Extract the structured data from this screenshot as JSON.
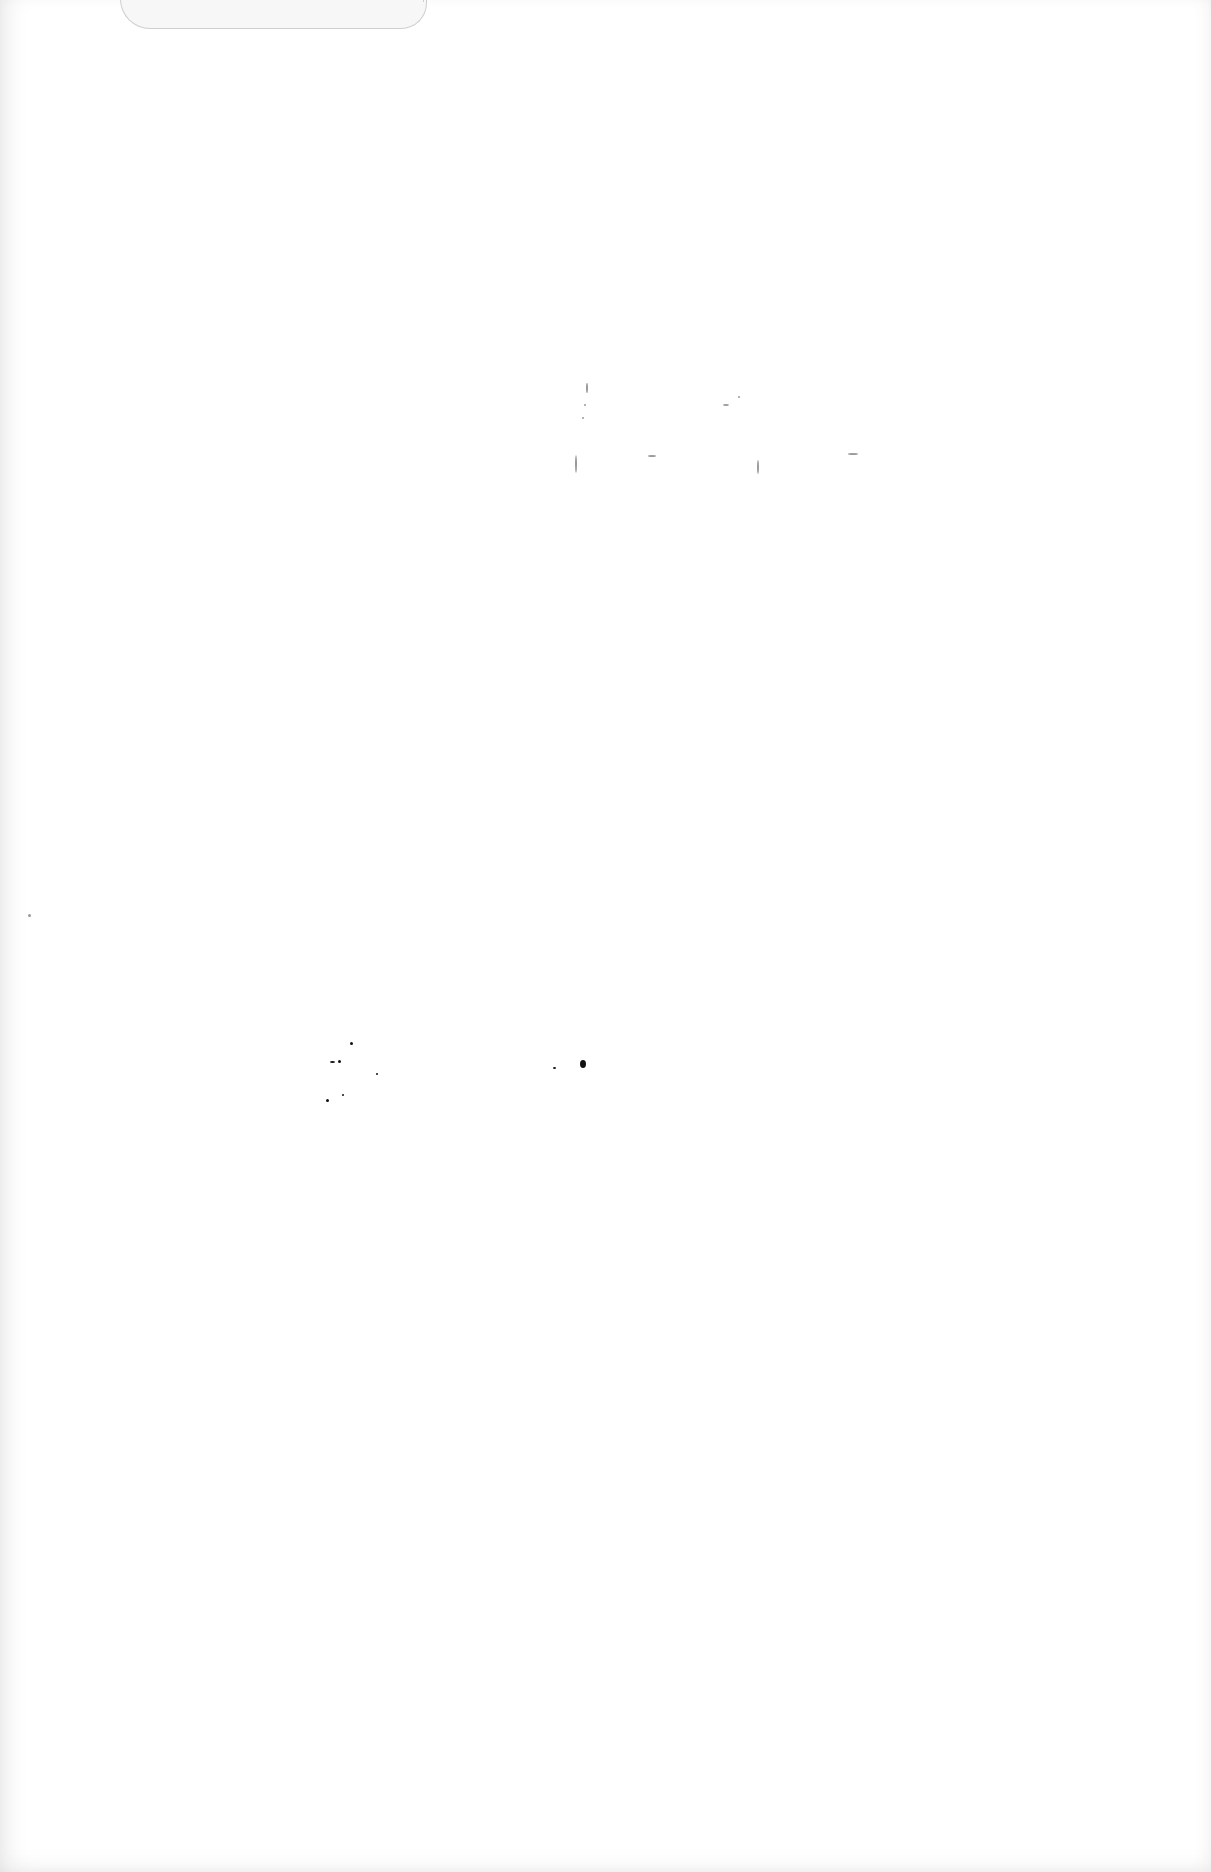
{
  "page": {
    "type": "blank scanned page",
    "background": "#ffffff",
    "text": ""
  },
  "artifacts": {
    "specks": [
      {
        "x": 586,
        "y": 383,
        "w": 2,
        "h": 10,
        "dark": false
      },
      {
        "x": 584,
        "y": 404,
        "w": 2,
        "h": 2,
        "dark": false
      },
      {
        "x": 582,
        "y": 417,
        "w": 2,
        "h": 2,
        "dark": false
      },
      {
        "x": 723,
        "y": 404,
        "w": 6,
        "h": 2,
        "dark": false
      },
      {
        "x": 738,
        "y": 396,
        "w": 2,
        "h": 2,
        "dark": false
      },
      {
        "x": 575,
        "y": 455,
        "w": 2,
        "h": 18,
        "dark": false
      },
      {
        "x": 648,
        "y": 455,
        "w": 8,
        "h": 2,
        "dark": false
      },
      {
        "x": 757,
        "y": 460,
        "w": 2,
        "h": 14,
        "dark": false
      },
      {
        "x": 848,
        "y": 453,
        "w": 10,
        "h": 2,
        "dark": false
      },
      {
        "x": 350,
        "y": 1042,
        "w": 3,
        "h": 3,
        "dark": true
      },
      {
        "x": 330,
        "y": 1061,
        "w": 5,
        "h": 2,
        "dark": true
      },
      {
        "x": 338,
        "y": 1060,
        "w": 3,
        "h": 3,
        "dark": true
      },
      {
        "x": 376,
        "y": 1073,
        "w": 2,
        "h": 2,
        "dark": true
      },
      {
        "x": 326,
        "y": 1099,
        "w": 3,
        "h": 3,
        "dark": true
      },
      {
        "x": 342,
        "y": 1094,
        "w": 2,
        "h": 2,
        "dark": true
      },
      {
        "x": 553,
        "y": 1067,
        "w": 3,
        "h": 2,
        "dark": true
      },
      {
        "x": 580,
        "y": 1060,
        "w": 6,
        "h": 8,
        "dark": true
      },
      {
        "x": 28,
        "y": 914,
        "w": 3,
        "h": 3,
        "dark": false
      }
    ]
  }
}
